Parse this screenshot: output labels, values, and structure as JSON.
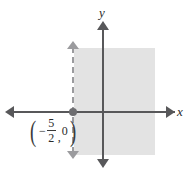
{
  "figure": {
    "name": "inequality-graph",
    "background_color": "#ffffff",
    "axes": {
      "x_label": "x",
      "y_label": "y",
      "axis_color": "#58585a"
    },
    "boundary": {
      "style": "dashed",
      "orientation": "vertical",
      "color": "#9b9b9e",
      "arrow_top": "▲",
      "arrow_bottom": "▼"
    },
    "shading": {
      "color": "#e3e3e3",
      "side": "right"
    },
    "point_label": {
      "open_paren": "(",
      "close_paren": ")",
      "negative_sign": "−",
      "numerator": "5",
      "denominator": "2",
      "comma": ",",
      "y_value": "0"
    }
  },
  "chart_data": {
    "type": "line",
    "title": "",
    "xlabel": "x",
    "ylabel": "y",
    "grid": false,
    "legend": null,
    "xlim": [
      -6.5,
      4.5
    ],
    "ylim": [
      -4.5,
      4.5
    ],
    "series": [
      {
        "name": "boundary-line",
        "kind": "vertical-dashed-line",
        "x": -2.5,
        "style": "dashed",
        "color": "#9b9b9e"
      },
      {
        "name": "solution-region",
        "kind": "shaded-half-plane",
        "inequality": "x > -5/2",
        "color": "#e3e3e3"
      },
      {
        "name": "x-intercept-point",
        "kind": "point",
        "x": -2.5,
        "y": 0,
        "label": "(-5/2, 0)",
        "color": "#6d6d70"
      }
    ],
    "annotations": [
      {
        "text": "(-5/2, 0)",
        "x": -4.0,
        "y": -0.9
      }
    ]
  }
}
